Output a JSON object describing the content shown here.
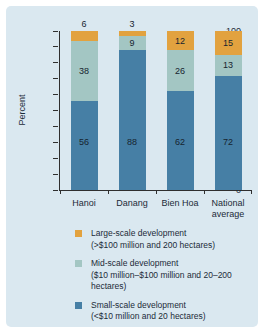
{
  "chart_data": {
    "type": "bar",
    "stacked": true,
    "title": "",
    "xlabel": "",
    "ylabel": "Percent",
    "ylim": [
      0,
      100
    ],
    "yticks": [
      0,
      10,
      20,
      30,
      40,
      50,
      60,
      70,
      80,
      90,
      100
    ],
    "grid": false,
    "legend_position": "bottom",
    "categories": [
      "Hanoi",
      "Danang",
      "Bien Hoa",
      "National average"
    ],
    "series": [
      {
        "name": "small-scale",
        "color": "#467fa5",
        "values": [
          56,
          88,
          62,
          72
        ]
      },
      {
        "name": "mid-scale",
        "color": "#a3c6c3",
        "values": [
          38,
          9,
          26,
          13
        ]
      },
      {
        "name": "large-scale",
        "color": "#e2a23f",
        "values": [
          6,
          3,
          12,
          15
        ]
      }
    ],
    "legend": [
      {
        "label": "Large-scale development",
        "sublabel": "(>$100 million and 200 hectares)",
        "color": "#e2a23f"
      },
      {
        "label": "Mid-scale development",
        "sublabel": "($10 million–$100 million and 20–200 hectares)",
        "color": "#a3c6c3"
      },
      {
        "label": "Small-scale development",
        "sublabel": "(<$10 million and 20 hectares)",
        "color": "#467fa5"
      }
    ]
  },
  "colors": {
    "page_bg": "#ffffff",
    "panel_bg": "#dae8f0",
    "axis": "#2f2f2f",
    "text": "#1c2b38"
  }
}
